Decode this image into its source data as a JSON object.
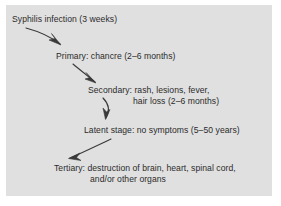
{
  "figure": {
    "kind": "flow-diagram",
    "background_color": "#ffffff",
    "panel_color": "#e0e0e0",
    "ink_color": "#3a3a3a",
    "text_color": "#2b2b2b"
  },
  "stages": [
    {
      "id": "infection",
      "label": "Syphilis infection (3 weeks)",
      "duration": "3 weeks"
    },
    {
      "id": "primary",
      "label": "Primary: chancre (2–6 months)",
      "duration": "2–6 months"
    },
    {
      "id": "secondary",
      "label": "Secondary: rash, lesions, fever,",
      "label_line2": "hair loss (2–6 months)",
      "duration": "2–6 months"
    },
    {
      "id": "latent",
      "label": "Latent stage: no symptoms (5–50 years)",
      "duration": "5–50 years"
    },
    {
      "id": "tertiary",
      "label": "Tertiary: destruction of brain, heart, spinal cord,",
      "label_line2": "and/or other organs",
      "duration": ""
    }
  ],
  "arrows": [
    {
      "id": "arrow-infection-to-primary",
      "direction": "down-right"
    },
    {
      "id": "arrow-primary-to-secondary",
      "direction": "down-right-steep"
    },
    {
      "id": "arrow-secondary-to-latent",
      "direction": "down-curved"
    },
    {
      "id": "arrow-latent-to-tertiary",
      "direction": "down-left"
    }
  ]
}
